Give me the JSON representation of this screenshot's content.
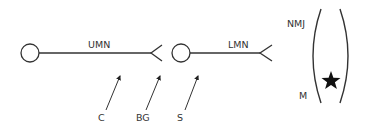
{
  "diagram": {
    "type": "neuron pathway schematic",
    "colors": {
      "stroke": "#333333",
      "background": "#ffffff",
      "star": "#111111"
    },
    "labels": {
      "upper_motor_neuron": "UMN",
      "lower_motor_neuron": "LMN",
      "neuromuscular_junction": "NMJ",
      "muscle": "M",
      "c": "C",
      "bg": "BG",
      "s": "S"
    },
    "nodes": [
      {
        "name": "UMN cell body",
        "shape": "circle"
      },
      {
        "name": "LMN cell body",
        "shape": "circle"
      },
      {
        "name": "muscle",
        "shape": "parentheses",
        "marker": "star"
      }
    ],
    "arrows": [
      {
        "label": "C",
        "points_to": "UMN axon"
      },
      {
        "label": "BG",
        "points_to": "UMN terminal synapse"
      },
      {
        "label": "S",
        "points_to": "LMN axon near cell body"
      }
    ]
  }
}
